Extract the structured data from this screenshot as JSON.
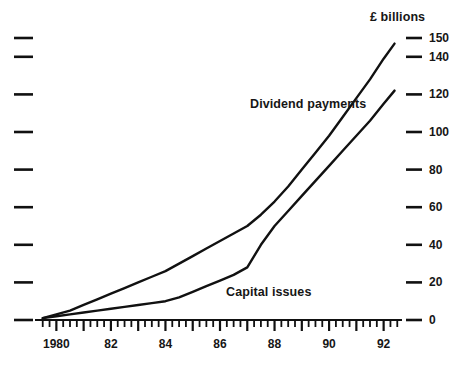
{
  "chart_data": {
    "type": "line",
    "title": "",
    "ylabel": "£ billions",
    "xlabel": "",
    "ylim": [
      0,
      150
    ],
    "xlim": [
      1979.4,
      1992.6
    ],
    "grid": false,
    "legend_position": "inline-annotations",
    "yticks": [
      0,
      20,
      40,
      60,
      80,
      100,
      120,
      140,
      150
    ],
    "ytick_labels": [
      "0",
      "20",
      "40",
      "60",
      "80",
      "100",
      "120",
      "140",
      "150"
    ],
    "left_axis_ticks_unlabeled": 9,
    "xticks": [
      1980,
      1982,
      1984,
      1986,
      1988,
      1990,
      1992
    ],
    "xtick_labels": [
      "1980",
      "82",
      "84",
      "86",
      "88",
      "90",
      "92"
    ],
    "x_minor_ticks": "quarterly",
    "x": [
      1979.5,
      1980,
      1980.5,
      1981,
      1981.5,
      1982,
      1982.5,
      1983,
      1983.5,
      1984,
      1984.5,
      1985,
      1985.5,
      1986,
      1986.5,
      1987,
      1987.5,
      1988,
      1988.5,
      1989,
      1989.5,
      1990,
      1990.5,
      1991,
      1991.5,
      1992,
      1992.4
    ],
    "series": [
      {
        "name": "Dividend payments",
        "color": "#111111",
        "values": [
          1,
          3,
          5,
          8,
          11,
          14,
          17,
          20,
          23,
          26,
          30,
          34,
          38,
          42,
          46,
          50,
          56,
          63,
          71,
          80,
          89,
          98,
          108,
          118,
          128,
          139,
          147
        ]
      },
      {
        "name": "Capital issues",
        "color": "#111111",
        "values": [
          1,
          2,
          3,
          4,
          5,
          6,
          7,
          8,
          9,
          10,
          12,
          15,
          18,
          21,
          24,
          28,
          40,
          50,
          58,
          66,
          74,
          82,
          90,
          98,
          106,
          115,
          122
        ]
      }
    ],
    "annotations": [
      {
        "text": "Dividend payments",
        "x_px": 250,
        "y_px": 97
      },
      {
        "text": "Capital issues",
        "x_px": 226,
        "y_px": 285
      }
    ],
    "axis_title_position": {
      "x_px": 370,
      "y_px": 10
    }
  },
  "colors": {
    "line": "#111111",
    "axis": "#111111",
    "background": "#ffffff",
    "text": "#161616"
  }
}
